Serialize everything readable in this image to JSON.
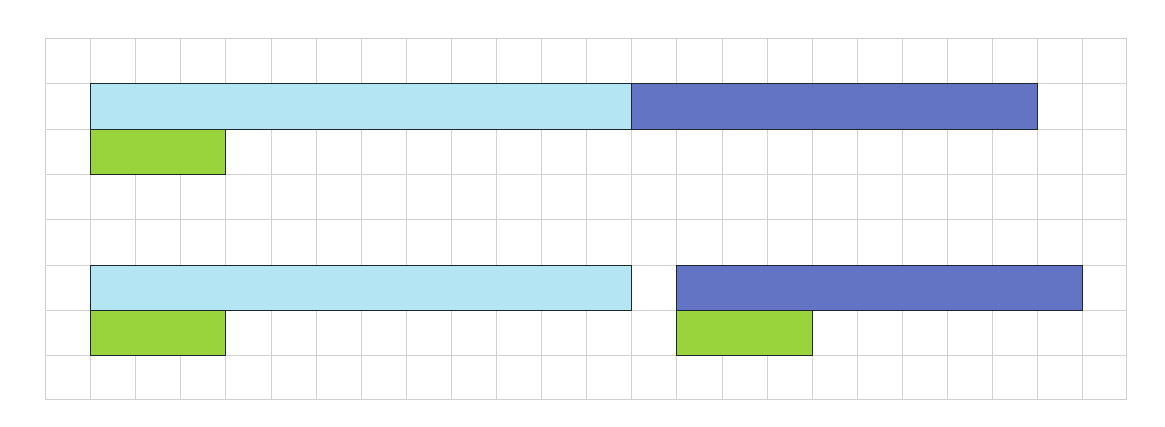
{
  "diagram": {
    "type": "bar-model-grid",
    "grid": {
      "columns": 24,
      "rows": 8,
      "cell_width": 45.1,
      "cell_height": 45.3,
      "line_color": "#d2d2d2",
      "background": "#ffffff"
    },
    "colors": {
      "light_blue": "#b3e5f3",
      "dark_blue": "#6374c4",
      "green": "#9ad43c",
      "outline": "#1d2730"
    },
    "bars": [
      {
        "name": "top-light-blue-bar",
        "row": 1,
        "col": 1,
        "span": 12,
        "color": "light_blue"
      },
      {
        "name": "top-dark-blue-bar",
        "row": 1,
        "col": 13,
        "span": 9,
        "color": "dark_blue"
      },
      {
        "name": "top-green-bar",
        "row": 2,
        "col": 1,
        "span": 3,
        "color": "green"
      },
      {
        "name": "bottom-light-blue-bar",
        "row": 5,
        "col": 1,
        "span": 12,
        "color": "light_blue"
      },
      {
        "name": "bottom-dark-blue-bar",
        "row": 5,
        "col": 14,
        "span": 9,
        "color": "dark_blue"
      },
      {
        "name": "bottom-green-bar",
        "row": 6,
        "col": 14,
        "span": 3,
        "color": "green"
      },
      {
        "name": "bottom-left-green-bar",
        "row": 6,
        "col": 1,
        "span": 3,
        "color": "green"
      }
    ]
  }
}
